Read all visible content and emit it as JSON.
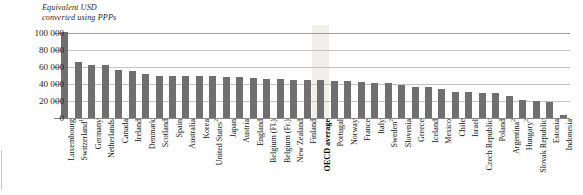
{
  "axis_note": "Equivalent USD\nconverted using PPPs",
  "chart_data": {
    "type": "bar",
    "title": "",
    "subtitle": "",
    "xlabel": "",
    "ylabel": "Equivalent USD converted using PPPs",
    "ylim": [
      0,
      100000
    ],
    "ytick_labels": [
      "100 000",
      "80 000",
      "60 000",
      "40 000",
      "20 000",
      "0"
    ],
    "ytick_values": [
      100000,
      80000,
      60000,
      40000,
      20000,
      0
    ],
    "grid": true,
    "legend": false,
    "highlight_category": "OECD average",
    "bar_color": "#6f6f6f",
    "highlight_color": "#efece6",
    "gridline_color": "#c4c4c4",
    "categories": [
      "Luxembourg",
      "Switzerland¹",
      "Germany",
      "Netherlands",
      "Canada",
      "Ireland",
      "Denmark",
      "Scotland",
      "Spain",
      "Australia",
      "Korea",
      "United States²",
      "Japan",
      "Austria",
      "England",
      "Belgium (Fl.)",
      "Belgium (Fr.)",
      "New Zealand",
      "Finland",
      "OECD average",
      "Portugal",
      "Norway",
      "France",
      "Italy",
      "Sweden²",
      "Slovenia",
      "Greece",
      "Iceland",
      "Mexico",
      "Chile",
      "Israel",
      "Czech Republic",
      "Poland",
      "Argentina²",
      "Hungary²",
      "Slovak Republic",
      "Estonia",
      "Indonesia"
    ],
    "values": [
      101000,
      66000,
      62000,
      62000,
      56000,
      55000,
      52000,
      50000,
      50000,
      49000,
      49000,
      49000,
      48000,
      48000,
      47000,
      46000,
      46000,
      45000,
      45000,
      45000,
      44000,
      43000,
      42000,
      41000,
      41000,
      39000,
      37000,
      37000,
      34000,
      31000,
      31000,
      30000,
      29000,
      26000,
      21000,
      20000,
      19000,
      4000
    ],
    "footnote_markers": [
      "1",
      "2"
    ]
  }
}
